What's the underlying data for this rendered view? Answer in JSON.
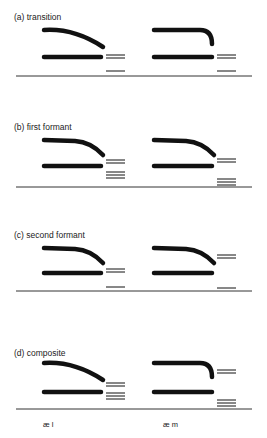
{
  "figure": {
    "ink_color": "#111111",
    "baseline_color": "#333333",
    "panels": [
      {
        "id": "a",
        "label": "(a) transition",
        "label_y": 12,
        "baseline_y": 76,
        "left": {
          "upper": {
            "y": 30,
            "shape": "gradual-fall"
          },
          "lower": {
            "y": 57
          },
          "bursts": [
            {
              "y": 55,
              "n": 2
            },
            {
              "y": 71,
              "n": 1
            }
          ]
        },
        "right": {
          "upper": {
            "y": 30,
            "shape": "sharp-fall"
          },
          "lower": {
            "y": 57
          },
          "bursts": [
            {
              "y": 55,
              "n": 2
            },
            {
              "y": 71,
              "n": 1
            }
          ]
        }
      },
      {
        "id": "b",
        "label": "(b) first formant",
        "label_y": 122,
        "baseline_y": 187,
        "left": {
          "upper": {
            "y": 140,
            "shape": "mid-fall"
          },
          "lower": {
            "y": 166
          },
          "bursts": [
            {
              "y": 160,
              "n": 2
            },
            {
              "y": 172,
              "n": 3
            }
          ]
        },
        "right": {
          "upper": {
            "y": 140,
            "shape": "mid-fall"
          },
          "lower": {
            "y": 166
          },
          "bursts": [
            {
              "y": 159,
              "n": 2
            },
            {
              "y": 179,
              "n": 3
            }
          ]
        }
      },
      {
        "id": "c",
        "label": "(c) second formant",
        "label_y": 230,
        "baseline_y": 291,
        "left": {
          "upper": {
            "y": 248,
            "shape": "mid-fall"
          },
          "lower": {
            "y": 273
          },
          "bursts": [
            {
              "y": 269,
              "n": 2
            },
            {
              "y": 287,
              "n": 1
            }
          ]
        },
        "right": {
          "upper": {
            "y": 248,
            "shape": "mid-fall"
          },
          "lower": {
            "y": 273
          },
          "bursts": [
            {
              "y": 255,
              "n": 2
            },
            {
              "y": 288,
              "n": 1
            }
          ]
        }
      },
      {
        "id": "d",
        "label": "(d) composite",
        "label_y": 348,
        "baseline_y": 409,
        "left": {
          "upper": {
            "y": 363,
            "shape": "gradual-fall"
          },
          "lower": {
            "y": 392
          },
          "bursts": [
            {
              "y": 383,
              "n": 2
            },
            {
              "y": 393,
              "n": 3
            }
          ]
        },
        "right": {
          "upper": {
            "y": 363,
            "shape": "sharp-fall"
          },
          "lower": {
            "y": 392
          },
          "bursts": [
            {
              "y": 370,
              "n": 2
            },
            {
              "y": 400,
              "n": 3
            }
          ]
        }
      }
    ],
    "segment_labels": [
      {
        "text": "æ l",
        "x": 43,
        "y": 420
      },
      {
        "text": "æ m",
        "x": 163,
        "y": 420
      }
    ]
  }
}
